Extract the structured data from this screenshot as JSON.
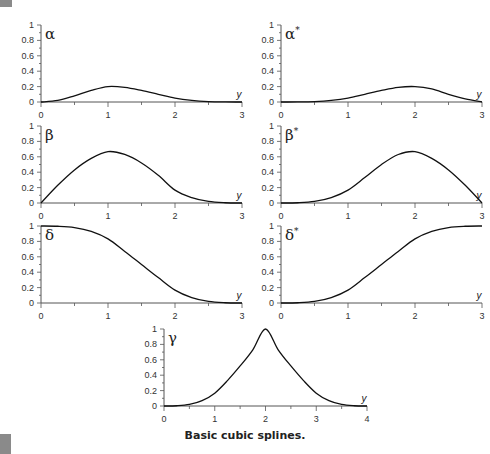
{
  "caption": "Basic cubic splines.",
  "colors": {
    "curve": "#111111",
    "axis": "#555555",
    "text": "#333333",
    "corner_mark": "#8a8a8a"
  },
  "chart_data": [
    {
      "type": "line",
      "id": "alpha",
      "title": "α",
      "xlabel": "y",
      "ylabel": "",
      "xlim": [
        0,
        3
      ],
      "ylim": [
        0,
        1
      ],
      "xticks": [
        "0",
        "1",
        "2",
        "3"
      ],
      "yticks": [
        "0",
        "0.2",
        "0.4",
        "0.6",
        "0.8",
        "1"
      ],
      "grid": false,
      "x": [
        0,
        0.25,
        0.5,
        0.75,
        1,
        1.25,
        1.5,
        1.75,
        2,
        2.25,
        2.5,
        2.75,
        3
      ],
      "values": [
        0,
        0.02,
        0.08,
        0.15,
        0.2,
        0.19,
        0.15,
        0.1,
        0.05,
        0.02,
        0.005,
        0.0005,
        0
      ]
    },
    {
      "type": "line",
      "id": "alpha_star",
      "title": "α*",
      "xlabel": "y",
      "xlim": [
        0,
        3
      ],
      "ylim": [
        0,
        1
      ],
      "xticks": [
        "0",
        "1",
        "2",
        "3"
      ],
      "yticks": [
        "0",
        "0.2",
        "0.4",
        "0.6",
        "0.8",
        "1"
      ],
      "grid": false,
      "x": [
        0,
        0.25,
        0.5,
        0.75,
        1,
        1.25,
        1.5,
        1.75,
        2,
        2.25,
        2.5,
        2.75,
        3
      ],
      "values": [
        0,
        0.0005,
        0.005,
        0.02,
        0.05,
        0.1,
        0.15,
        0.19,
        0.2,
        0.17,
        0.1,
        0.04,
        0
      ]
    },
    {
      "type": "line",
      "id": "beta",
      "title": "β",
      "xlabel": "y",
      "xlim": [
        0,
        3
      ],
      "ylim": [
        0,
        1
      ],
      "xticks": [
        "0",
        "1",
        "2",
        "3"
      ],
      "yticks": [
        "0",
        "0.2",
        "0.4",
        "0.6",
        "0.8",
        "1"
      ],
      "grid": false,
      "x": [
        0,
        0.25,
        0.5,
        0.75,
        1,
        1.25,
        1.5,
        1.75,
        2,
        2.25,
        2.5,
        2.75,
        3
      ],
      "values": [
        0,
        0.23,
        0.43,
        0.58,
        0.667,
        0.63,
        0.52,
        0.36,
        0.167,
        0.07,
        0.02,
        0.003,
        0
      ]
    },
    {
      "type": "line",
      "id": "beta_star",
      "title": "β*",
      "xlabel": "y",
      "xlim": [
        0,
        3
      ],
      "ylim": [
        0,
        1
      ],
      "xticks": [
        "0",
        "1",
        "2",
        "3"
      ],
      "yticks": [
        "0",
        "0.2",
        "0.4",
        "0.6",
        "0.8",
        "1"
      ],
      "grid": false,
      "x": [
        0,
        0.25,
        0.5,
        0.75,
        1,
        1.25,
        1.5,
        1.75,
        2,
        2.25,
        2.5,
        2.75,
        3
      ],
      "values": [
        0,
        0.003,
        0.02,
        0.07,
        0.167,
        0.33,
        0.5,
        0.63,
        0.667,
        0.58,
        0.43,
        0.23,
        0
      ]
    },
    {
      "type": "line",
      "id": "delta",
      "title": "δ",
      "xlabel": "y",
      "xlim": [
        0,
        3
      ],
      "ylim": [
        0,
        1
      ],
      "xticks": [
        "0",
        "1",
        "2",
        "3"
      ],
      "yticks": [
        "0",
        "0.2",
        "0.4",
        "0.6",
        "0.8",
        "1"
      ],
      "grid": false,
      "x": [
        0,
        0.25,
        0.5,
        0.75,
        1,
        1.25,
        1.5,
        1.75,
        2,
        2.25,
        2.5,
        2.75,
        3
      ],
      "values": [
        1,
        0.997,
        0.98,
        0.93,
        0.833,
        0.67,
        0.5,
        0.33,
        0.167,
        0.07,
        0.02,
        0.003,
        0
      ]
    },
    {
      "type": "line",
      "id": "delta_star",
      "title": "δ*",
      "xlabel": "y",
      "xlim": [
        0,
        3
      ],
      "ylim": [
        0,
        1
      ],
      "xticks": [
        "0",
        "1",
        "2",
        "3"
      ],
      "yticks": [
        "0",
        "0.2",
        "0.4",
        "0.6",
        "0.8",
        "1"
      ],
      "grid": false,
      "x": [
        0,
        0.25,
        0.5,
        0.75,
        1,
        1.25,
        1.5,
        1.75,
        2,
        2.25,
        2.5,
        2.75,
        3
      ],
      "values": [
        0,
        0.003,
        0.02,
        0.07,
        0.167,
        0.33,
        0.5,
        0.67,
        0.833,
        0.93,
        0.98,
        0.997,
        1
      ]
    },
    {
      "type": "line",
      "id": "gamma",
      "title": "γ",
      "xlabel": "y",
      "xlim": [
        0,
        4
      ],
      "ylim": [
        0,
        1
      ],
      "xticks": [
        "0",
        "1",
        "2",
        "3",
        "4"
      ],
      "yticks": [
        "0",
        "0.2",
        "0.4",
        "0.6",
        "0.8",
        "1"
      ],
      "grid": false,
      "x": [
        0,
        0.25,
        0.5,
        0.75,
        1,
        1.25,
        1.5,
        1.75,
        2,
        2.25,
        2.5,
        2.75,
        3,
        3.25,
        3.5,
        3.75,
        4
      ],
      "values": [
        0,
        0.003,
        0.02,
        0.07,
        0.167,
        0.33,
        0.52,
        0.73,
        1.0,
        0.73,
        0.52,
        0.33,
        0.167,
        0.07,
        0.02,
        0.003,
        0
      ]
    }
  ]
}
